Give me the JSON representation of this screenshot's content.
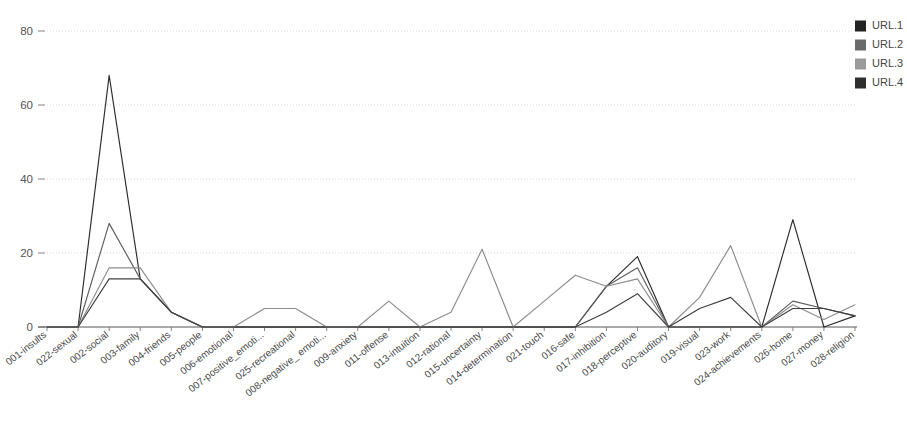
{
  "chart_data": {
    "type": "line",
    "title": "",
    "subtitle": "",
    "xlabel": "",
    "ylabel": "",
    "ylim": [
      0,
      85
    ],
    "yticks": [
      0,
      20,
      40,
      60,
      80
    ],
    "grid": true,
    "legend_position": "top-right",
    "categories": [
      "001-insults",
      "022-sexual",
      "002-social",
      "003-family",
      "004-friends",
      "005-people",
      "006-emotional",
      "007-positive_emoti...",
      "025-recreational",
      "008-negative_ emoti...",
      "009-anxiety",
      "011-offense",
      "013-intuition",
      "012-rational",
      "015-uncertainty",
      "014-determination",
      "021-touch",
      "016-safe",
      "017-inhibition",
      "018-perceptive",
      "020-auditory",
      "019-visual",
      "023-work",
      "024-achievements",
      "026-home",
      "027-money",
      "028-religion"
    ],
    "series": [
      {
        "name": "URL.1",
        "color": "#2b2b2b",
        "values": [
          0,
          0,
          68,
          13,
          4,
          0,
          0,
          0,
          0,
          0,
          0,
          0,
          0,
          0,
          0,
          0,
          0,
          0,
          11,
          19,
          0,
          0,
          0,
          0,
          29,
          0,
          3
        ]
      },
      {
        "name": "URL.2",
        "color": "#5e5e5e",
        "values": [
          0,
          0,
          28,
          13,
          4,
          0,
          0,
          0,
          0,
          0,
          0,
          0,
          0,
          0,
          0,
          0,
          0,
          0,
          11,
          16,
          0,
          0,
          0,
          0,
          7,
          5,
          3
        ]
      },
      {
        "name": "URL.3",
        "color": "#8c8c8c",
        "values": [
          0,
          0,
          16,
          16,
          4,
          0,
          0,
          5,
          5,
          0,
          0,
          7,
          0,
          4,
          21,
          0,
          7,
          14,
          11,
          13,
          0,
          8,
          22,
          0,
          6,
          2,
          6
        ]
      },
      {
        "name": "URL.4",
        "color": "#3f3f3f",
        "values": [
          0,
          0,
          13,
          13,
          4,
          0,
          0,
          0,
          0,
          0,
          0,
          0,
          0,
          0,
          0,
          0,
          0,
          0,
          4,
          9,
          0,
          5,
          8,
          0,
          5,
          5,
          3
        ]
      }
    ]
  },
  "legend": {
    "entries": [
      {
        "label": "URL.1",
        "color": "#232323"
      },
      {
        "label": "URL.2",
        "color": "#6a6a6a"
      },
      {
        "label": "URL.3",
        "color": "#9a9a9a"
      },
      {
        "label": "URL.4",
        "color": "#2e2e2e"
      }
    ]
  },
  "axes": {
    "y_tick_labels": [
      "0",
      "20",
      "40",
      "60",
      "80"
    ]
  }
}
